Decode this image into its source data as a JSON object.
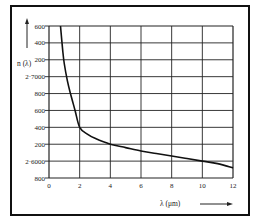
{
  "chart_data": {
    "type": "line",
    "title": "",
    "xlabel": "λ (μm)",
    "ylabel": "n (λ)",
    "xlim": [
      0,
      12
    ],
    "ylim": [
      2.58,
      2.76
    ],
    "x_ticks": [
      "0",
      "2",
      "4",
      "6",
      "8",
      "10",
      "12"
    ],
    "y_ticks": [
      "600",
      "400",
      "200",
      "2·7000",
      "800",
      "600",
      "400",
      "200",
      "2·6000",
      "800"
    ],
    "grid": true,
    "series": [
      {
        "name": "n(λ)",
        "x": [
          0.75,
          0.9,
          1.0,
          1.2,
          1.4,
          1.7,
          2.0,
          2.5,
          3.0,
          4.0,
          5.0,
          6.0,
          7.0,
          8.0,
          9.0,
          10.0,
          11.0,
          12.0
        ],
        "y": [
          2.76,
          2.73,
          2.715,
          2.695,
          2.68,
          2.66,
          2.64,
          2.632,
          2.627,
          2.62,
          2.616,
          2.612,
          2.609,
          2.606,
          2.603,
          2.6,
          2.597,
          2.592
        ]
      }
    ]
  },
  "labels": {
    "y_axis": "n (λ)",
    "x_axis": "λ (μm)"
  }
}
